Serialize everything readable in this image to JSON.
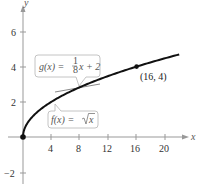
{
  "chart_data": {
    "type": "line",
    "title": "",
    "xlabel": "x",
    "ylabel": "y",
    "xlim": [
      -0.5,
      23
    ],
    "ylim": [
      -3,
      7.5
    ],
    "grid": false,
    "x_ticks": [
      4,
      8,
      12,
      16,
      20
    ],
    "y_ticks": [
      -2,
      2,
      4,
      6
    ],
    "series": [
      {
        "name": "f(x) = √x",
        "function": "sqrt(x)",
        "domain": [
          0,
          22
        ],
        "color": "#111111",
        "points": [
          [
            0,
            0
          ],
          [
            1,
            1
          ],
          [
            4,
            2
          ],
          [
            9,
            3
          ],
          [
            16,
            4
          ],
          [
            22,
            4.69
          ]
        ]
      },
      {
        "name": "g(x) = (1/8)x + 2",
        "function": "x/8 + 2",
        "domain": [
          4.5,
          8
        ],
        "color": "#888888",
        "points": [
          [
            4.5,
            2.56
          ],
          [
            8,
            3
          ]
        ]
      }
    ],
    "annotations": [
      {
        "text": "(16, 4)",
        "x": 16,
        "y": 4,
        "type": "point-label"
      },
      {
        "text": "g(x) = 1/8 x + 2",
        "type": "callout"
      },
      {
        "text": "f(x) = √x",
        "type": "callout"
      }
    ],
    "marked_points": [
      [
        0,
        0
      ],
      [
        16,
        4
      ]
    ]
  },
  "labels": {
    "x_axis": "x",
    "y_axis": "y",
    "x_ticks": [
      "4",
      "8",
      "12",
      "16",
      "20"
    ],
    "y_ticks": [
      "6",
      "4",
      "2",
      "−2"
    ],
    "point_label": "(16, 4)",
    "g_callout": {
      "lhs": "g(x) = ",
      "num": "1",
      "den": "8",
      "rhs": "x + 2"
    },
    "f_callout": {
      "lhs": "f(x) = ",
      "rad": "x"
    }
  }
}
